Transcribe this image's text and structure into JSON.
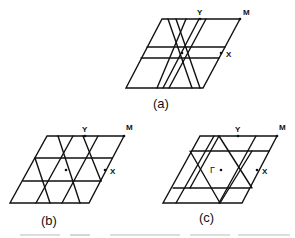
{
  "figure": {
    "panels": [
      {
        "id": "a",
        "caption": "(a)",
        "points": {
          "Y": "Y",
          "M": "M",
          "X": "X"
        },
        "center_label": ""
      },
      {
        "id": "b",
        "caption": "(b)",
        "points": {
          "Y": "Y",
          "M": "M",
          "X": "X"
        },
        "center_label": ""
      },
      {
        "id": "c",
        "caption": "(c)",
        "points": {
          "Y": "Y",
          "M": "M",
          "X": "X"
        },
        "center_label": "Γ"
      }
    ],
    "colors": {
      "line": "#111111",
      "background": "#ffffff"
    }
  }
}
